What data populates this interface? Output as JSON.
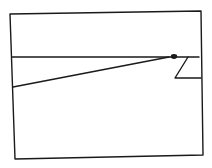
{
  "diagram": {
    "background": "#ffffff",
    "stroke_color": "#1a1a1a",
    "stroke_width": 1.4,
    "frame": {
      "points": "10,14 201,11 203,155 15,159"
    },
    "horizontal_line": {
      "x1": 12,
      "y1": 57,
      "x2": 199,
      "y2": 57
    },
    "diagonal_line": {
      "x1": 13,
      "y1": 87,
      "x2": 169,
      "y2": 57
    },
    "blob": {
      "cx": 174,
      "cy": 56.5,
      "rx": 3.2,
      "ry": 2.4
    },
    "z_shape": {
      "points": "188,57 175,78 201,78"
    }
  }
}
